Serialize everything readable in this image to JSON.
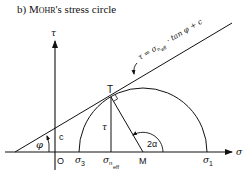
{
  "title": {
    "prefix": "b)",
    "name_small_caps": "Mohr",
    "suffix": "'s stress circle"
  },
  "axes": {
    "x_label": "σ",
    "y_label": "τ",
    "origin_label": "O"
  },
  "envelope": {
    "equation_lhs": "τ = σ",
    "equation_sub": "n",
    "equation_subsub": "eff",
    "equation_rhs": "· tan φ + c"
  },
  "points": {
    "tangent_point": "T",
    "center": "M",
    "sigma3": "σ",
    "sigma3_sub": "3",
    "sigma1": "σ",
    "sigma1_sub": "1",
    "sigma_n_eff": "σ",
    "sigma_n_eff_sub": "n",
    "sigma_n_eff_subsub": "eff"
  },
  "annotations": {
    "friction_angle": "φ",
    "cohesion": "c",
    "shear_stress": "τ",
    "double_angle": "2α"
  },
  "colors": {
    "line": "#111111",
    "background": "#ffffff"
  }
}
